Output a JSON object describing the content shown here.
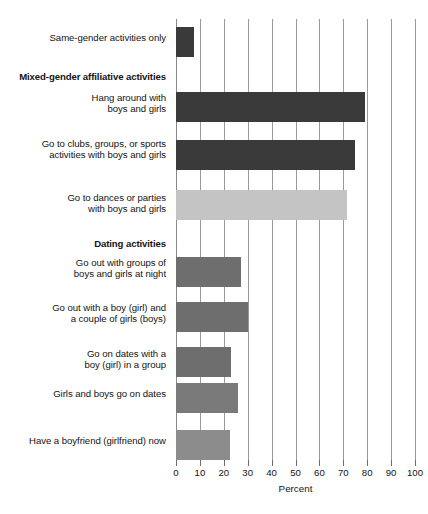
{
  "chart_data": {
    "type": "bar",
    "orientation": "horizontal",
    "title": "",
    "xlabel": "Percent",
    "ylabel": "",
    "xlim": [
      0,
      100
    ],
    "xticks": [
      0,
      10,
      20,
      30,
      40,
      50,
      60,
      70,
      80,
      90,
      100
    ],
    "grid": "vertical",
    "legend": "none",
    "categories": [
      "Same-gender activities only",
      "Hang around with\nboys and girls",
      "Go to clubs, groups, or sports\nactivities with boys and girls",
      "Go to dances or parties\nwith boys and girls",
      "Go out with groups of\nboys and girls at night",
      "Go out with a boy (girl) and\na couple of girls (boys)",
      "Go on dates with a\nboy (girl) in a group",
      "Girls and boys go on dates",
      "Have a boyfriend (girlfriend) now"
    ],
    "values": [
      7.5,
      79,
      75,
      71.5,
      27,
      30,
      23,
      26,
      22.5
    ],
    "bar_colors": [
      "#3a3a3a",
      "#3a3a3a",
      "#3a3a3a",
      "#c4c4c4",
      "#6e6e6e",
      "#6e6e6e",
      "#6e6e6e",
      "#7a7a7a",
      "#8c8c8c"
    ],
    "group_headers": [
      {
        "label": "Mixed-gender affiliative activities",
        "after_category_index": 0
      },
      {
        "label": "Dating activities",
        "after_category_index": 3
      }
    ]
  },
  "rows": [
    {
      "label": "Same-gender activities only",
      "bold": false,
      "top": 32,
      "value": 7.5,
      "bar_top": 27,
      "color": "#3a3a3a"
    },
    {
      "label": "Mixed-gender affiliative activities",
      "bold": true,
      "top": 71,
      "value": null,
      "bar_top": null,
      "color": null
    },
    {
      "label": "Hang around with\nboys and girls",
      "bold": false,
      "top": 92,
      "value": 79,
      "bar_top": 92,
      "color": "#3a3a3a"
    },
    {
      "label": "Go to clubs, groups, or sports\nactivities with boys and girls",
      "bold": false,
      "top": 138,
      "value": 75,
      "bar_top": 140,
      "color": "#3a3a3a"
    },
    {
      "label": "Go to dances or parties\nwith boys and girls",
      "bold": false,
      "top": 192,
      "value": 71.5,
      "bar_top": 190,
      "color": "#c4c4c4"
    },
    {
      "label": "Dating activities",
      "bold": true,
      "top": 238,
      "value": null,
      "bar_top": null,
      "color": null
    },
    {
      "label": "Go out with groups of\nboys and girls at night",
      "bold": false,
      "top": 257,
      "value": 27,
      "bar_top": 257,
      "color": "#6e6e6e"
    },
    {
      "label": "Go out with a boy (girl) and\na couple of girls (boys)",
      "bold": false,
      "top": 302,
      "value": 30,
      "bar_top": 302,
      "color": "#6e6e6e"
    },
    {
      "label": "Go on dates with a\nboy (girl) in a group",
      "bold": false,
      "top": 348,
      "value": 23,
      "bar_top": 347,
      "color": "#6e6e6e"
    },
    {
      "label": "Girls and boys go on dates",
      "bold": false,
      "top": 388,
      "value": 26,
      "bar_top": 383,
      "color": "#7a7a7a"
    },
    {
      "label": "Have a boyfriend (girlfriend) now",
      "bold": false,
      "top": 435,
      "value": 22.5,
      "bar_top": 430,
      "color": "#8c8c8c"
    }
  ],
  "axis": {
    "title": "Percent",
    "ticks": [
      "0",
      "10",
      "20",
      "30",
      "40",
      "50",
      "60",
      "70",
      "80",
      "90",
      "100"
    ]
  }
}
